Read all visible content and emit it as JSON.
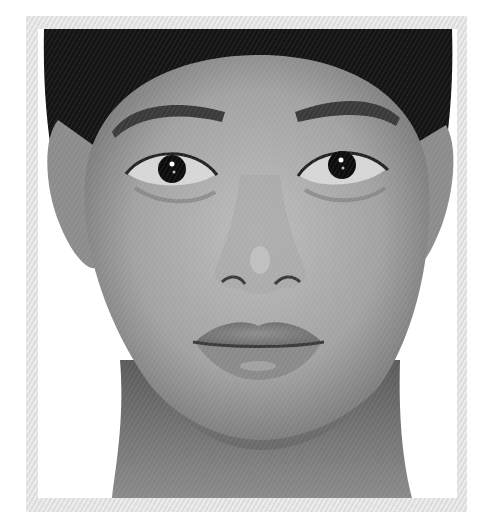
{
  "image": {
    "description": "Grayscale frontal portrait of a woman with dark hair pulled back, inside a light hatched photo frame",
    "colors": {
      "frame": "#e4e4e4",
      "background": "#ffffff",
      "hair": "#141414",
      "skin_light": "#b8b8b8",
      "skin_mid": "#8e8e8e",
      "skin_dark": "#5e5e5e",
      "iris": "#0c0c0c",
      "sclera": "#d8d8d8",
      "lips": "#7a7a7a"
    },
    "features": {
      "left_eye_center": [
        172,
        169
      ],
      "right_eye_center": [
        342,
        165
      ],
      "nose_tip": [
        260,
        275
      ],
      "mouth_center": [
        258,
        340
      ]
    }
  }
}
